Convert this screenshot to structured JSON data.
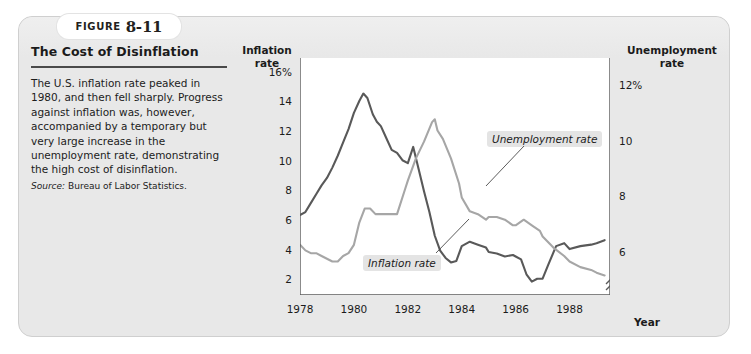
{
  "figure": {
    "word": "Figure",
    "number": "8-11"
  },
  "caption": {
    "title": "The Cost of Disinflation",
    "body": "The U.S. inflation rate peaked in 1980, and then fell sharply. Progress against inflation was, however, accompanied by a temporary but very large increase in the unemployment rate, demonstrating the high cost of disinflation.",
    "source_label": "Source:",
    "source_text": "Bureau of Labor Statistics."
  },
  "chart_data": {
    "type": "line",
    "title": "The Cost of Disinflation",
    "xlabel": "Year",
    "ylabel": "Inflation rate",
    "y2label": "Unemployment rate",
    "grid": false,
    "legend_position": "inline-annotations",
    "xlim": [
      1978,
      1989.5
    ],
    "xticks": [
      "1978",
      "1980",
      "1982",
      "1984",
      "1986",
      "1988"
    ],
    "xtick_values": [
      1978,
      1980,
      1982,
      1984,
      1986,
      1988
    ],
    "ylim": [
      1,
      17
    ],
    "yticks": [
      "2",
      "4",
      "6",
      "8",
      "10",
      "12",
      "14",
      "16%"
    ],
    "ytick_values": [
      2,
      4,
      6,
      8,
      10,
      12,
      14,
      16
    ],
    "y2lim": [
      4.5,
      13.0
    ],
    "y2ticks": [
      "6",
      "8",
      "10",
      "12%"
    ],
    "y2tick_values": [
      6,
      8,
      10,
      12
    ],
    "y2_axis_break": true,
    "series": [
      {
        "name": "Inflation rate",
        "axis": "left",
        "color": "#595959",
        "annotation": "Inflation rate",
        "x": [
          1978.0,
          1978.2,
          1978.4,
          1978.6,
          1978.8,
          1979.0,
          1979.2,
          1979.4,
          1979.6,
          1979.8,
          1980.0,
          1980.2,
          1980.35,
          1980.5,
          1980.7,
          1980.85,
          1981.0,
          1981.2,
          1981.4,
          1981.6,
          1981.8,
          1982.0,
          1982.2,
          1982.4,
          1982.6,
          1982.8,
          1983.0,
          1983.2,
          1983.4,
          1983.6,
          1983.8,
          1984.0,
          1984.3,
          1984.6,
          1984.9,
          1985.0,
          1985.3,
          1985.6,
          1985.9,
          1986.0,
          1986.2,
          1986.4,
          1986.6,
          1986.8,
          1987.0,
          1987.2,
          1987.5,
          1987.8,
          1988.0,
          1988.4,
          1988.8,
          1989.0,
          1989.3
        ],
        "y": [
          6.4,
          6.6,
          7.2,
          7.8,
          8.4,
          8.9,
          9.6,
          10.4,
          11.3,
          12.2,
          13.3,
          14.1,
          14.6,
          14.3,
          13.2,
          12.7,
          12.4,
          11.6,
          10.8,
          10.6,
          10.1,
          9.9,
          11.0,
          9.5,
          8.0,
          6.6,
          5.0,
          4.0,
          3.5,
          3.2,
          3.3,
          4.3,
          4.6,
          4.4,
          4.2,
          3.9,
          3.8,
          3.6,
          3.7,
          3.6,
          3.4,
          2.4,
          1.9,
          2.1,
          2.1,
          3.0,
          4.3,
          4.5,
          4.1,
          4.3,
          4.4,
          4.5,
          4.7
        ]
      },
      {
        "name": "Unemployment rate",
        "axis": "right",
        "color": "#a6a6a6",
        "annotation": "Unemployment rate",
        "x": [
          1978.0,
          1978.2,
          1978.4,
          1978.6,
          1978.8,
          1979.0,
          1979.2,
          1979.4,
          1979.6,
          1979.8,
          1980.0,
          1980.2,
          1980.4,
          1980.6,
          1980.8,
          1981.0,
          1981.3,
          1981.6,
          1981.9,
          1982.0,
          1982.3,
          1982.6,
          1982.9,
          1983.0,
          1983.1,
          1983.3,
          1983.6,
          1983.9,
          1984.0,
          1984.3,
          1984.6,
          1984.9,
          1985.0,
          1985.3,
          1985.6,
          1985.9,
          1986.0,
          1986.3,
          1986.6,
          1986.9,
          1987.0,
          1987.4,
          1987.8,
          1988.0,
          1988.4,
          1988.8,
          1989.0,
          1989.3
        ],
        "y": [
          6.3,
          6.1,
          6.0,
          6.0,
          5.9,
          5.8,
          5.7,
          5.7,
          5.9,
          6.0,
          6.3,
          7.1,
          7.6,
          7.6,
          7.4,
          7.4,
          7.4,
          7.4,
          8.3,
          8.6,
          9.4,
          10.0,
          10.7,
          10.8,
          10.4,
          10.1,
          9.4,
          8.5,
          8.0,
          7.5,
          7.4,
          7.2,
          7.3,
          7.3,
          7.2,
          7.0,
          7.0,
          7.2,
          7.0,
          6.8,
          6.6,
          6.2,
          5.9,
          5.7,
          5.5,
          5.4,
          5.3,
          5.2
        ]
      }
    ]
  }
}
